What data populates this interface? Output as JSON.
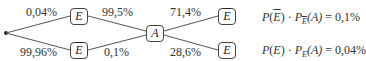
{
  "tree": {
    "root": {
      "label": ""
    },
    "level1": [
      {
        "event": "E",
        "overline": false,
        "probability": "0,04%"
      },
      {
        "event": "E",
        "overline": true,
        "probability": "99,96%"
      }
    ],
    "middle_edges": [
      {
        "from": "E",
        "probability": "99,5%"
      },
      {
        "from": "Ē",
        "probability": "0,1%"
      }
    ],
    "merge_node": {
      "event": "A"
    },
    "level2": [
      {
        "event": "E",
        "overline": true,
        "probability": "71,4%"
      },
      {
        "event": "E",
        "overline": false,
        "probability": "28,6%"
      }
    ]
  },
  "formulas": [
    {
      "P": "P",
      "arg": "E",
      "arg_overline": true,
      "dot": "·",
      "P2": "P",
      "sub": "E",
      "sub_overline": true,
      "arg2": "(A)",
      "eq": "=",
      "value": "0,1%"
    },
    {
      "P": "P",
      "arg": "E",
      "arg_overline": false,
      "dot": "·",
      "P2": "P",
      "sub": "E",
      "sub_overline": false,
      "arg2": "(A)",
      "eq": "=",
      "value": "0,04%"
    }
  ]
}
